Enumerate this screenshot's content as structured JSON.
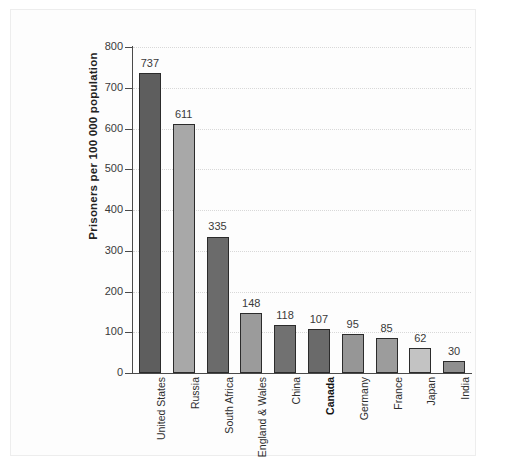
{
  "chart_data": {
    "type": "bar",
    "title": "",
    "xlabel": "",
    "ylabel": "Prisoners per 100 000 population",
    "ylim": [
      0,
      800
    ],
    "ytick_step": 100,
    "yticks": [
      "800",
      "700",
      "600",
      "500",
      "400",
      "300",
      "200",
      "100",
      "0"
    ],
    "grid": true,
    "grid_style": "dotted-horizontal",
    "legend": "none",
    "categories": [
      "United States",
      "Russia",
      "South Africa",
      "England & Wales",
      "China",
      "Canada",
      "Germany",
      "France",
      "Japan",
      "India"
    ],
    "values": [
      737,
      611,
      335,
      148,
      118,
      107,
      95,
      85,
      62,
      30
    ],
    "value_labels": [
      "737",
      "611",
      "335",
      "148",
      "118",
      "107",
      "95",
      "85",
      "62",
      "30"
    ],
    "highlighted_category": "Canada",
    "bar_colors": [
      "#5e5e5e",
      "#a8a8a8",
      "#6b6b6b",
      "#9b9b9b",
      "#717171",
      "#6a6a6a",
      "#969696",
      "#9c9c9c",
      "#c3c3c3",
      "#8f8f8f"
    ],
    "bar_edge_color": "#2b2b2b",
    "axis_color": "#4a4a4a",
    "grid_color": "#d8d8d8",
    "background_color": "#fdfdfd",
    "text_color": "#3a3a3a"
  }
}
